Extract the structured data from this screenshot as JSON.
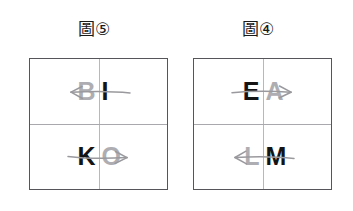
{
  "page": {
    "background_color": "#ffffff",
    "dark_letter_color": "#141414",
    "light_letter_color": "#aeaeb2",
    "box_border_color": "#55555a",
    "divider_color": "#b8b8bc",
    "arrow_color": "#9a9a9e"
  },
  "figures": [
    {
      "caption": "圖⑤",
      "caption_label": "figure-5",
      "grid": {
        "rows": [
          {
            "row_name": "top-row",
            "left_cell": {
              "letter": "B",
              "tone": "light"
            },
            "right_cell": {
              "letter": "I",
              "tone": "dark"
            },
            "arrow": {
              "direction": "left",
              "icon": "arrow-left-icon",
              "from": "I",
              "to": "B"
            }
          },
          {
            "row_name": "bottom-row",
            "left_cell": {
              "letter": "K",
              "tone": "dark"
            },
            "right_cell": {
              "letter": "O",
              "tone": "light"
            },
            "arrow": {
              "direction": "right",
              "icon": "arrow-right-icon",
              "from": "K",
              "to": "O"
            }
          }
        ]
      }
    },
    {
      "caption": "圖④",
      "caption_label": "figure-4",
      "grid": {
        "rows": [
          {
            "row_name": "top-row",
            "left_cell": {
              "letter": "E",
              "tone": "dark"
            },
            "right_cell": {
              "letter": "A",
              "tone": "light"
            },
            "arrow": {
              "direction": "right",
              "icon": "arrow-right-icon",
              "from": "E",
              "to": "A"
            }
          },
          {
            "row_name": "bottom-row",
            "left_cell": {
              "letter": "L",
              "tone": "light"
            },
            "right_cell": {
              "letter": "M",
              "tone": "dark"
            },
            "arrow": {
              "direction": "left",
              "icon": "arrow-left-icon",
              "from": "M",
              "to": "L"
            }
          }
        ]
      }
    }
  ]
}
